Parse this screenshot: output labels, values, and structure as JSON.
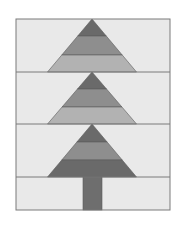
{
  "colors": {
    "page_background": "#ffffff",
    "block_background": "#e9e9e9",
    "outline": "#7a7a7a",
    "dark": "#6a6a6a",
    "medium": "#8e8e8e",
    "light": "#b2b2b2",
    "trunk": "#6e6e6e"
  },
  "frame": {
    "x": 16,
    "y": 19,
    "width": 154,
    "height": 191
  },
  "rows": [
    {
      "name": "tree-tier-1",
      "top": 19,
      "bottom": 72,
      "apex_x": 92,
      "base_left": 48,
      "base_right": 137,
      "bands": [
        {
          "tone": "dark",
          "from": 19,
          "to": 36
        },
        {
          "tone": "medium",
          "from": 36,
          "to": 55
        },
        {
          "tone": "light",
          "from": 55,
          "to": 72
        }
      ]
    },
    {
      "name": "tree-tier-2",
      "top": 72,
      "bottom": 124,
      "apex_x": 92,
      "base_left": 48,
      "base_right": 137,
      "bands": [
        {
          "tone": "dark",
          "from": 72,
          "to": 89
        },
        {
          "tone": "medium",
          "from": 89,
          "to": 107
        },
        {
          "tone": "light",
          "from": 107,
          "to": 124
        }
      ]
    },
    {
      "name": "tree-tier-3",
      "top": 124,
      "bottom": 177,
      "apex_x": 92,
      "base_left": 48,
      "base_right": 137,
      "bands": [
        {
          "tone": "dark",
          "from": 124,
          "to": 142
        },
        {
          "tone": "medium",
          "from": 142,
          "to": 160
        },
        {
          "tone": "dark",
          "from": 160,
          "to": 177
        }
      ]
    }
  ],
  "trunk": {
    "x": 83,
    "y": 177,
    "width": 19,
    "height": 33
  }
}
